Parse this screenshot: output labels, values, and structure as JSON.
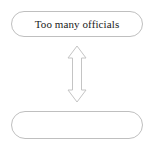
{
  "diagram": {
    "type": "two-node-bidirectional-flow",
    "background_color": "#ffffff",
    "outline_color": "#bfbfbf",
    "text_color": "#1a1a1a",
    "nodes": [
      {
        "id": "top",
        "shape": "rounded-pill",
        "label": "Too many officials",
        "empty": false
      },
      {
        "id": "bottom",
        "shape": "rounded-pill",
        "label": "",
        "empty": true
      }
    ],
    "connector": {
      "id": "double-arrow",
      "style": "hollow-outline",
      "direction": "bidirectional-vertical",
      "label": ""
    }
  }
}
